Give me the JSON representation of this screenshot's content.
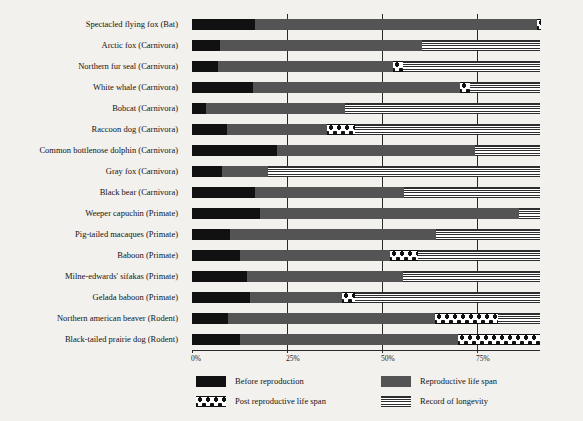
{
  "chart_data": {
    "type": "bar",
    "orientation": "horizontal",
    "stacked": true,
    "title": "",
    "xlabel": "",
    "ylabel": "",
    "xlim": [
      0,
      91.6
    ],
    "xticks": [
      0,
      25,
      50,
      75
    ],
    "xtick_labels": [
      "0%",
      "25%",
      "50%",
      "75%"
    ],
    "grid": true,
    "grid_axis": "x",
    "legend_position": "bottom",
    "units": "percent of maximum life span",
    "categories": [
      "Spectacled flying fox (Bat)",
      "Arctic fox (Carnivora)",
      "Northern fur seal (Carnivora)",
      "White whale (Carnivora)",
      "Bobcat (Carnivora)",
      "Raccoon dog (Carnivora)",
      "Common bottlenose dolphin (Carnivora)",
      "Gray fox (Carnivora)",
      "Black bear (Carnivora)",
      "Weeper capuchin (Primate)",
      "Pig-tailed macaques (Primate)",
      "Baboon (Primate)",
      "Milne-edwards' sifakas (Primate)",
      "Gelada baboon (Primate)",
      "Northern american beaver (Rodent)",
      "Black-tailed prairie dog (Rodent)"
    ],
    "series": [
      {
        "name": "Before reproduction",
        "color": "#111111",
        "pattern": "solid-black",
        "values": [
          16.6,
          7.4,
          6.9,
          16.1,
          3.7,
          9.2,
          22.4,
          7.9,
          16.6,
          18.0,
          10.0,
          12.6,
          14.5,
          15.3,
          9.5,
          12.6
        ]
      },
      {
        "name": "Reproductive life span",
        "color": "#545454",
        "pattern": "solid-gray",
        "values": [
          74.2,
          53.2,
          46.1,
          54.5,
          36.6,
          26.3,
          52.1,
          12.1,
          39.2,
          68.2,
          54.2,
          39.5,
          41.1,
          24.2,
          54.5,
          57.4
        ]
      },
      {
        "name": "Post reproductive life span",
        "color": "#ffffff",
        "pattern": "polka-dot",
        "values": [
          1.1,
          0,
          2.6,
          2.6,
          0,
          7.4,
          0,
          0,
          0,
          0,
          0,
          7.4,
          0,
          3.4,
          16.6,
          21.6
        ]
      },
      {
        "name": "Record of longevity",
        "color": "#ffffff",
        "pattern": "horizontal-lines",
        "values": [
          0,
          31.0,
          36.0,
          18.4,
          51.3,
          48.7,
          17.1,
          71.6,
          35.8,
          5.4,
          27.4,
          32.1,
          36.0,
          48.7,
          11.0,
          0
        ]
      }
    ]
  },
  "legend": {
    "items": [
      {
        "label": "Before reproduction",
        "swatch": "sw-before"
      },
      {
        "label": "Reproductive life span",
        "swatch": "sw-repro"
      },
      {
        "label": "Post reproductive life span",
        "swatch": "sw-post"
      },
      {
        "label": "Record of longevity",
        "swatch": "sw-long"
      }
    ]
  },
  "colors": {
    "background": "#f2f1ee",
    "before_reproduction": "#111111",
    "reproductive_life_span": "#545454",
    "axis": "#2a2a2a",
    "text": "#141414"
  }
}
